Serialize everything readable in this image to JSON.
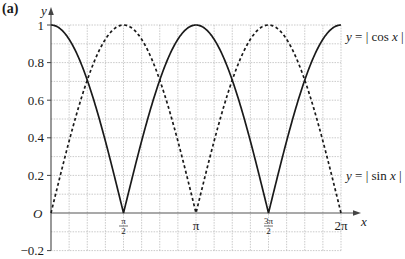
{
  "panel_label": "(a)",
  "chart_data": {
    "type": "line",
    "title": "",
    "xlabel": "x",
    "ylabel": "y",
    "origin_label": "O",
    "xlim": [
      0,
      6.2832
    ],
    "ylim": [
      -0.2,
      1
    ],
    "grid": true,
    "x_ticks": [
      {
        "value": 1.5708,
        "label_num": "π",
        "label_den": "2"
      },
      {
        "value": 3.1416,
        "label": "π"
      },
      {
        "value": 4.7124,
        "label_num": "3π",
        "label_den": "2"
      },
      {
        "value": 6.2832,
        "label": "2π"
      }
    ],
    "y_ticks": [
      {
        "value": -0.2,
        "label": "−0.2"
      },
      {
        "value": 0.2,
        "label": "0.2"
      },
      {
        "value": 0.4,
        "label": "0.4"
      },
      {
        "value": 0.6,
        "label": "0.6"
      },
      {
        "value": 0.8,
        "label": "0.8"
      },
      {
        "value": 1,
        "label": "1"
      }
    ],
    "series": [
      {
        "name": "y = |cos x|",
        "style": "solid",
        "x": [
          0,
          0.3927,
          0.7854,
          1.1781,
          1.5708,
          1.9635,
          2.3562,
          2.7489,
          3.1416,
          3.5343,
          3.927,
          4.3197,
          4.7124,
          5.1051,
          5.4978,
          5.8905,
          6.2832
        ],
        "values": [
          1,
          0.924,
          0.707,
          0.383,
          0,
          0.383,
          0.707,
          0.924,
          1,
          0.924,
          0.707,
          0.383,
          0,
          0.383,
          0.707,
          0.924,
          1
        ]
      },
      {
        "name": "y = |sin x|",
        "style": "dashed",
        "x": [
          0,
          0.3927,
          0.7854,
          1.1781,
          1.5708,
          1.9635,
          2.3562,
          2.7489,
          3.1416,
          3.5343,
          3.927,
          4.3197,
          4.7124,
          5.1051,
          5.4978,
          5.8905,
          6.2832
        ],
        "values": [
          0,
          0.383,
          0.707,
          0.924,
          1,
          0.924,
          0.707,
          0.383,
          0,
          0.383,
          0.707,
          0.924,
          1,
          0.924,
          0.707,
          0.383,
          0
        ]
      }
    ],
    "annotations": [
      {
        "text": "y = | cos x |",
        "near": "right end of solid curve at y=1"
      },
      {
        "text": "y = | sin x |",
        "near": "right end of dashed curve at y≈0.1"
      }
    ],
    "legend": "inline labels at right"
  },
  "labels": {
    "cos_prefix": "y = ",
    "cos_body": "| cos ",
    "cos_var": "x",
    "cos_suffix": " |",
    "sin_prefix": "y = ",
    "sin_body": "| sin ",
    "sin_var": "x",
    "sin_suffix": " |"
  }
}
